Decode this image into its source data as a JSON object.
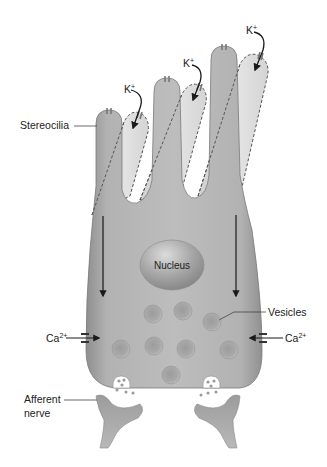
{
  "diagram": {
    "labels": {
      "stereocilia": "Stereocilia",
      "nucleus": "Nucleus",
      "vesicles": "Vesicles",
      "calcium_left": "Ca",
      "calcium_left_sup": "2+",
      "calcium_right": "Ca",
      "calcium_right_sup": "2+",
      "afferent_line1": "Afferent",
      "afferent_line2": "nerve",
      "potassium": [
        {
          "text": "K",
          "sup": "+"
        },
        {
          "text": "K",
          "sup": "+"
        },
        {
          "text": "K",
          "sup": "+"
        }
      ]
    },
    "colors": {
      "cell_fill": "#b4b4b4",
      "cell_shadow": "#8e8e8e",
      "deflected_fill": "#dcdcdc",
      "outline": "#6a6a6a",
      "arrow": "#1a1a1a",
      "text": "#222222"
    }
  }
}
